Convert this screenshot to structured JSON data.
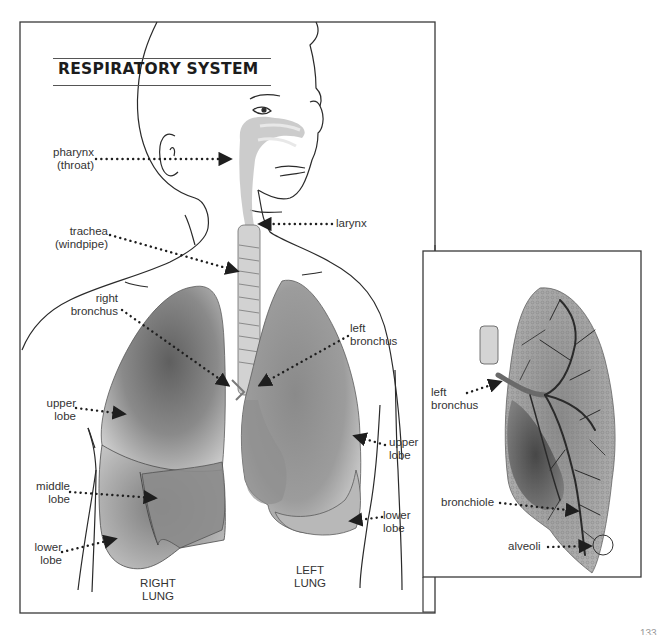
{
  "title": "RESPIRATORY SYSTEM",
  "main_panel": {
    "labels": {
      "pharynx": "pharynx\n(throat)",
      "larynx": "larynx",
      "trachea": "trachea\n(windpipe)",
      "right_bronchus": "right\nbronchus",
      "left_bronchus": "left\nbronchus",
      "right_upper_lobe": "upper\nlobe",
      "right_middle_lobe": "middle\nlobe",
      "right_lower_lobe": "lower\nlobe",
      "left_upper_lobe": "upper\nlobe",
      "left_lower_lobe": "lower\nlobe",
      "right_lung": "RIGHT\nLUNG",
      "left_lung": "LEFT\nLUNG"
    }
  },
  "inset_panel": {
    "labels": {
      "left_bronchus": "left\nbronchus",
      "bronchiole": "bronchiole",
      "alveoli": "alveoli"
    }
  },
  "page_number": "133",
  "colors": {
    "frame": "#3a3a3a",
    "line_art": "#2a2a2a",
    "lung_dark": "#6e6e6e",
    "lung_mid": "#9a9a9a",
    "lung_light": "#d4d4d4",
    "airway": "#c8c8c8",
    "leader_dots": "#1e1e1e"
  }
}
